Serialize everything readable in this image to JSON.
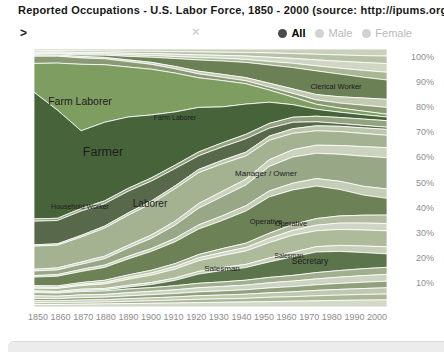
{
  "window": {
    "title": "Reported Occupations - U.S. Labor Force, 1850 - 2000 (source: http://ipums.org)"
  },
  "toolbar": {
    "prompt": ">",
    "search_value": "",
    "clear_label": "×",
    "filters": [
      {
        "label": "All",
        "selected": true
      },
      {
        "label": "Male",
        "selected": false
      },
      {
        "label": "Female",
        "selected": false
      }
    ],
    "colors": {
      "selected_dot": "#4b4b4b",
      "unselected_dot": "#d2d2d2",
      "selected_text": "#000000",
      "unselected_text": "#b9b9b9"
    }
  },
  "axes": {
    "y_ticks": [
      "100%",
      "90%",
      "80%",
      "70%",
      "60%",
      "50%",
      "40%",
      "30%",
      "20%",
      "10%"
    ],
    "x_ticks": [
      "1850",
      "1860",
      "1870",
      "1880",
      "1890",
      "1900",
      "1910",
      "1920",
      "1930",
      "1940",
      "1950",
      "1960",
      "1970",
      "1980",
      "1990",
      "2000"
    ]
  },
  "chart_data": {
    "type": "area",
    "stacked": true,
    "normalized_to_100pct": true,
    "title": "Reported Occupations - U.S. Labor Force, 1850 - 2000",
    "xlabel": "Year",
    "ylabel": "% of labor force",
    "ylim": [
      0,
      100
    ],
    "grid": false,
    "legend_position": "labels-on-bands",
    "x": [
      1850,
      1860,
      1870,
      1880,
      1890,
      1900,
      1910,
      1920,
      1930,
      1940,
      1950,
      1960,
      1970,
      1980,
      1990,
      2000
    ],
    "series": [
      {
        "label": "",
        "color": "#c9d1bb",
        "values": [
          0.6,
          0.6,
          0.7,
          0.7,
          0.8,
          0.8,
          0.9,
          1.0,
          1.1,
          1.2,
          1.3,
          1.5,
          1.7,
          1.9,
          2.1,
          2.3
        ]
      },
      {
        "label": "",
        "color": "#b6c1a6",
        "values": [
          0.5,
          0.5,
          0.6,
          0.6,
          0.7,
          0.8,
          0.9,
          1.0,
          1.1,
          1.2,
          1.4,
          1.6,
          1.8,
          2.0,
          2.2,
          2.4
        ]
      },
      {
        "label": "",
        "color": "#cfd6c3",
        "values": [
          0.4,
          0.4,
          0.5,
          0.5,
          0.6,
          0.7,
          0.8,
          0.9,
          1.0,
          1.2,
          1.4,
          1.6,
          1.9,
          2.2,
          2.5,
          2.8
        ]
      },
      {
        "label": "",
        "color": "#a9b795",
        "values": [
          0.3,
          0.3,
          0.4,
          0.4,
          0.5,
          0.6,
          0.7,
          0.8,
          0.9,
          1.0,
          1.2,
          1.4,
          1.6,
          1.9,
          2.2,
          2.5
        ]
      },
      {
        "label": "Clerical Worker",
        "color": "#6b8055",
        "values": [
          0.3,
          0.4,
          0.5,
          0.8,
          1.2,
          1.8,
          2.8,
          3.8,
          4.6,
          5.2,
          6.0,
          7.0,
          7.6,
          7.2,
          6.6,
          6.2
        ]
      },
      {
        "label": "",
        "color": "#c2cbb2",
        "values": [
          0.4,
          0.4,
          0.5,
          0.5,
          0.6,
          0.7,
          0.8,
          0.9,
          1.0,
          1.1,
          1.3,
          1.5,
          1.7,
          2.0,
          2.3,
          2.6
        ]
      },
      {
        "label": "",
        "color": "#8a9a74",
        "values": [
          2.5,
          2.5,
          2.3,
          2.1,
          1.9,
          1.7,
          1.5,
          1.3,
          1.1,
          1.0,
          1.0,
          1.2,
          1.4,
          1.6,
          1.9,
          2.2
        ]
      },
      {
        "label": "Farm Laborer",
        "color": "#7e9d60",
        "values": [
          10,
          17,
          24,
          20.5,
          17.5,
          16,
          13.5,
          10,
          9,
          7,
          4,
          2.5,
          1.6,
          1.3,
          1.1,
          0.9
        ]
      },
      {
        "label": "Farmer",
        "color": "#47633a",
        "values": [
          44,
          39,
          28,
          28,
          25,
          22,
          18.5,
          15,
          12.3,
          10.4,
          7,
          4.1,
          2.2,
          1.7,
          1.4,
          1.2
        ]
      },
      {
        "label": "",
        "color": "#93a37f",
        "values": [
          0.8,
          0.8,
          0.9,
          1.0,
          1.0,
          1.1,
          1.2,
          1.3,
          1.4,
          1.5,
          1.6,
          1.7,
          1.8,
          1.9,
          2.0,
          2.1
        ]
      },
      {
        "label": "Household Worker",
        "color": "#57694a",
        "values": [
          8.2,
          8.4,
          8.8,
          8.0,
          7.6,
          7.0,
          6.0,
          4.6,
          4.6,
          4.6,
          2.6,
          2.1,
          1.3,
          0.9,
          0.8,
          0.7
        ]
      },
      {
        "label": "",
        "color": "#bcc6ab",
        "values": [
          0.5,
          0.5,
          0.6,
          0.7,
          0.8,
          0.9,
          1.0,
          1.1,
          1.2,
          1.3,
          1.4,
          1.5,
          1.6,
          1.7,
          1.8,
          1.9
        ]
      },
      {
        "label": "Laborer",
        "color": "#a4b291",
        "values": [
          8,
          8.2,
          9,
          10,
          10.5,
          11,
          11.3,
          10.4,
          9.4,
          8,
          6.4,
          5.4,
          4.6,
          4.4,
          4.2,
          4.0
        ]
      },
      {
        "label": "",
        "color": "#cbd2bd",
        "values": [
          0.6,
          0.7,
          0.8,
          0.9,
          1.0,
          1.2,
          1.4,
          1.6,
          1.8,
          2.0,
          2.2,
          2.4,
          2.6,
          2.8,
          3.0,
          3.2
        ]
      },
      {
        "label": "Manager / Owner",
        "color": "#98a887",
        "values": [
          1.6,
          1.7,
          1.9,
          2.3,
          2.9,
          3.6,
          4.6,
          5.6,
          6.6,
          7.1,
          8.1,
          8.6,
          8.1,
          8.6,
          9.6,
          10.1
        ]
      },
      {
        "label": "",
        "color": "#c4cdb5",
        "values": [
          0.5,
          0.6,
          0.7,
          0.8,
          0.9,
          1.0,
          1.2,
          1.4,
          1.6,
          1.8,
          2.0,
          2.2,
          2.4,
          2.6,
          2.8,
          3.0
        ]
      },
      {
        "label": "Operative",
        "color": "#6d8156",
        "values": [
          3.0,
          3.5,
          4.0,
          4.6,
          5.6,
          6.6,
          7.6,
          8.6,
          9.6,
          11,
          12,
          11.4,
          10.4,
          8.4,
          6.4,
          5.4
        ]
      },
      {
        "label": "",
        "color": "#b1bd9e",
        "values": [
          0.5,
          0.5,
          0.6,
          0.7,
          0.8,
          0.9,
          1.0,
          1.1,
          1.3,
          1.5,
          1.7,
          1.9,
          2.1,
          2.3,
          2.5,
          2.7
        ]
      },
      {
        "label": "",
        "color": "#d0d6c4",
        "values": [
          0.4,
          0.4,
          0.5,
          0.6,
          0.7,
          0.8,
          0.9,
          1.0,
          1.1,
          1.2,
          1.4,
          1.6,
          1.8,
          2.0,
          2.2,
          2.4
        ]
      },
      {
        "label": "Salesman",
        "color": "#aebb9a",
        "values": [
          0.9,
          1.1,
          1.3,
          1.6,
          2.1,
          2.6,
          3.1,
          3.6,
          4.1,
          4.6,
          5.1,
          5.6,
          5.1,
          5.1,
          5.1,
          5.1
        ]
      },
      {
        "label": "",
        "color": "#c7cfb8",
        "values": [
          0.4,
          0.4,
          0.5,
          0.5,
          0.6,
          0.7,
          0.8,
          0.9,
          1.0,
          1.1,
          1.3,
          1.5,
          1.7,
          1.9,
          2.1,
          2.3
        ]
      },
      {
        "label": "Secretary",
        "color": "#5c744b",
        "values": [
          0.2,
          0.2,
          0.3,
          0.4,
          0.7,
          1.1,
          1.9,
          3.1,
          3.9,
          4.3,
          5.1,
          6.1,
          6.6,
          6.1,
          5.1,
          4.3
        ]
      },
      {
        "label": "",
        "color": "#a0af8e",
        "values": [
          1.1,
          1.1,
          1.2,
          1.2,
          1.3,
          1.3,
          1.4,
          1.5,
          1.6,
          1.7,
          1.8,
          1.9,
          2.0,
          2.1,
          2.2,
          2.3
        ]
      },
      {
        "label": "",
        "color": "#ccd3c0",
        "values": [
          0.9,
          0.9,
          1.0,
          1.0,
          1.1,
          1.2,
          1.3,
          1.4,
          1.5,
          1.6,
          1.7,
          1.8,
          1.9,
          2.0,
          2.1,
          2.2
        ]
      },
      {
        "label": "",
        "color": "#8fa07b",
        "values": [
          0.8,
          0.8,
          0.9,
          0.9,
          1.0,
          1.1,
          1.2,
          1.3,
          1.4,
          1.5,
          1.6,
          1.7,
          1.8,
          1.9,
          2.0,
          2.1
        ]
      },
      {
        "label": "",
        "color": "#c0c9af",
        "values": [
          0.7,
          0.7,
          0.8,
          0.8,
          0.9,
          1.0,
          1.1,
          1.2,
          1.3,
          1.4,
          1.5,
          1.6,
          1.7,
          1.8,
          1.9,
          2.0
        ]
      },
      {
        "label": "",
        "color": "#aab794",
        "values": [
          0.6,
          0.6,
          0.7,
          0.7,
          0.8,
          0.9,
          1.0,
          1.1,
          1.2,
          1.3,
          1.4,
          1.5,
          1.6,
          1.7,
          1.8,
          1.9
        ]
      },
      {
        "label": "",
        "color": "#d3d9c8",
        "values": [
          0.9,
          0.9,
          1.0,
          1.1,
          1.2,
          1.3,
          1.4,
          1.5,
          1.6,
          1.7,
          1.8,
          1.9,
          2.0,
          2.1,
          2.2,
          2.3
        ]
      }
    ],
    "band_labels": [
      {
        "text": "Farm Laborer",
        "x": 80,
        "y": 101,
        "size": 10.5
      },
      {
        "text": "Farm Laborer",
        "x": 175,
        "y": 117,
        "size": 7
      },
      {
        "text": "Farmer",
        "x": 103,
        "y": 152,
        "size": 12.5
      },
      {
        "text": "Household Worker",
        "x": 80,
        "y": 207,
        "size": 7
      },
      {
        "text": "Laborer",
        "x": 150,
        "y": 203,
        "size": 10
      },
      {
        "text": "Manager / Owner",
        "x": 266,
        "y": 173,
        "size": 8
      },
      {
        "text": "Operative",
        "x": 266,
        "y": 221,
        "size": 7.5
      },
      {
        "text": "Operative",
        "x": 291,
        "y": 223,
        "size": 7.5
      },
      {
        "text": "Salesman",
        "x": 222,
        "y": 268,
        "size": 8
      },
      {
        "text": "Salesman",
        "x": 289,
        "y": 256,
        "size": 6.5
      },
      {
        "text": "Secretary",
        "x": 310,
        "y": 261,
        "size": 8.5
      },
      {
        "text": "Clerical Worker",
        "x": 336,
        "y": 86,
        "size": 7.5
      }
    ],
    "plot_area": {
      "left": 34,
      "top": 49,
      "width": 353,
      "height": 258
    },
    "band_separator_color": "#ffffff",
    "label_color": "#1c1c1c"
  }
}
